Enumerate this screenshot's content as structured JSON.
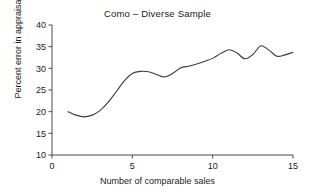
{
  "chart_data": {
    "type": "line",
    "title": "Como – Diverse Sample",
    "xlabel": "Number of comparable sales",
    "ylabel": "Percent error in appraisal",
    "xlim": [
      0,
      15
    ],
    "ylim": [
      10,
      40
    ],
    "xticks": [
      "0",
      "5",
      "10",
      "15"
    ],
    "xtick_values": [
      0,
      5,
      10,
      15
    ],
    "yticks": [
      "10",
      "15",
      "20",
      "25",
      "30",
      "35",
      "40"
    ],
    "ytick_values": [
      10,
      15,
      20,
      25,
      30,
      35,
      40
    ],
    "grid": false,
    "legend": "none",
    "line_color": "#3c3c3c",
    "series": [
      {
        "name": "Percent error in appraisal",
        "x": [
          1.0,
          1.5,
          2.0,
          2.5,
          3.0,
          3.5,
          4.0,
          4.5,
          5.0,
          5.5,
          6.0,
          6.5,
          7.0,
          7.5,
          8.0,
          8.5,
          9.0,
          9.5,
          10.0,
          10.5,
          11.0,
          11.5,
          12.0,
          12.5,
          13.0,
          13.5,
          14.0,
          14.5,
          15.0
        ],
        "values": [
          20.0,
          19.2,
          18.8,
          19.2,
          20.3,
          22.2,
          24.6,
          27.1,
          28.8,
          29.3,
          29.2,
          28.6,
          28.0,
          28.8,
          30.1,
          30.5,
          31.0,
          31.6,
          32.3,
          33.4,
          34.3,
          33.6,
          32.2,
          33.2,
          35.2,
          34.2,
          32.8,
          33.1,
          33.7
        ]
      }
    ]
  }
}
